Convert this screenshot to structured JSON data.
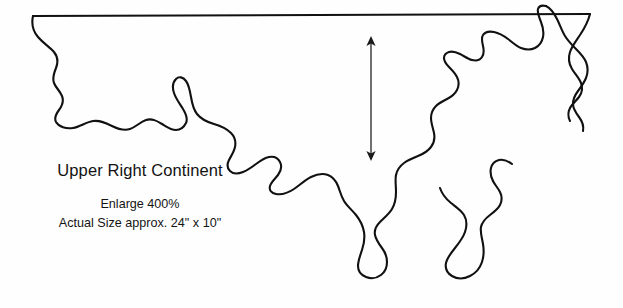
{
  "page": {
    "background_color": "#fefefe",
    "width": 623,
    "height": 308
  },
  "artwork": {
    "name": "upper-right-continent-outline",
    "stroke_color": "#111111",
    "stroke_width": 2.1,
    "fill": "none",
    "description": "Hand-drawn stylized coastline of the upper right quadrant of a world map, with a straight ruled line across the top edge and an irregular wandering coastline below."
  },
  "labels": {
    "title": "Upper Right Continent",
    "enlarge": "Enlarge 400%",
    "actual_size": "Actual Size approx. 24\" x 10\""
  },
  "measure_arrow": {
    "name": "vertical-double-arrow",
    "color": "#1a1a1a",
    "x": 371,
    "y_top": 37,
    "y_bottom": 160,
    "head_style": "double"
  }
}
